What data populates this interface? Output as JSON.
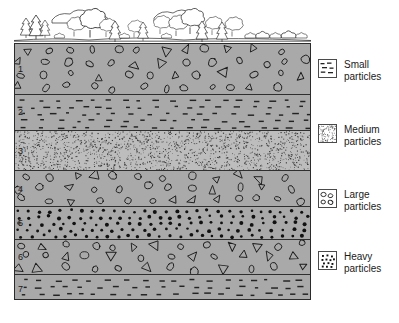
{
  "figure": {
    "type": "geological-cross-section"
  },
  "landscape": {
    "name": "surface-landscape",
    "features": [
      "conifer-trees",
      "deciduous-trees",
      "shrubs",
      "clouds",
      "ground-line"
    ]
  },
  "cross_section": {
    "layers": [
      {
        "number": "1",
        "pattern": "large",
        "tone": "grey",
        "height_pct": 20.0
      },
      {
        "number": "2",
        "pattern": "small",
        "tone": "grey",
        "height_pct": 14.0
      },
      {
        "number": "3",
        "pattern": "medium",
        "tone": "light",
        "height_pct": 16.0
      },
      {
        "number": "4",
        "pattern": "large",
        "tone": "grey",
        "height_pct": 14.0
      },
      {
        "number": "5",
        "pattern": "heavy",
        "tone": "grey",
        "height_pct": 13.0
      },
      {
        "number": "6",
        "pattern": "large",
        "tone": "grey",
        "height_pct": 13.5
      },
      {
        "number": "7",
        "pattern": "small",
        "tone": "grey",
        "height_pct": 11.5
      },
      {
        "number": "8",
        "pattern": "medium",
        "tone": "light",
        "height_pct": 14.0
      }
    ]
  },
  "legend": {
    "entries": [
      {
        "swatch": "small-particles-swatch",
        "line1": "Small",
        "line2": "particles",
        "top_px": 4
      },
      {
        "swatch": "medium-particles-swatch",
        "line1": "Medium",
        "line2": "particles",
        "top_px": 69
      },
      {
        "swatch": "large-particles-swatch",
        "line1": "Large",
        "line2": "particles",
        "top_px": 134
      },
      {
        "swatch": "heavy-particles-swatch",
        "line1": "Heavy",
        "line2": "particles",
        "top_px": 196
      }
    ]
  },
  "colors": {
    "layer_grey": "#a9a9a9",
    "layer_light": "#bdbdbd",
    "ink": "#1a1a1a",
    "boundary": "#2f2f2f",
    "page": "#ffffff"
  }
}
